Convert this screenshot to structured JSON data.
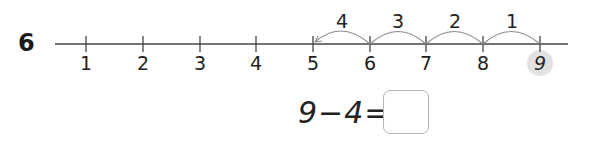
{
  "question": {
    "number": "6"
  },
  "number_line": {
    "ticks": [
      "1",
      "2",
      "3",
      "4",
      "5",
      "6",
      "7",
      "8",
      "9"
    ],
    "highlighted": "9",
    "jumps": [
      {
        "from": "9",
        "to": "8",
        "label": "1"
      },
      {
        "from": "8",
        "to": "7",
        "label": "2"
      },
      {
        "from": "7",
        "to": "6",
        "label": "3"
      },
      {
        "from": "6",
        "to": "5",
        "label": "4"
      }
    ]
  },
  "equation": {
    "text": "9−4=",
    "answer": ""
  }
}
